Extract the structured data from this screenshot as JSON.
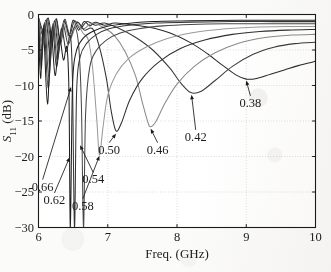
{
  "chart_data": {
    "type": "line",
    "title": "",
    "xlabel": "Freq. (GHz)",
    "ylabel": "S_11 (dB)",
    "ylabel_base": "S",
    "ylabel_sub": "11",
    "ylabel_unit": " (dB)",
    "xlim": [
      6,
      10
    ],
    "ylim": [
      -30,
      0
    ],
    "xticks": [
      6,
      7,
      8,
      9,
      10
    ],
    "xticklabels": [
      "6",
      "7",
      "8",
      "9",
      "10"
    ],
    "yticks": [
      0,
      -5,
      -10,
      -15,
      -20,
      -25,
      -30
    ],
    "yticklabels": [
      "0",
      "−5",
      "−10",
      "−15",
      "−20",
      "−25",
      "−30"
    ],
    "grid": "dotted",
    "legend": "none",
    "series": [
      {
        "name": "0.38",
        "color": "#2a2a2a",
        "min_freq": 9.0,
        "min_value": -9.1,
        "points": [
          [
            6.0,
            -0.4
          ],
          [
            6.08,
            -2.6
          ],
          [
            6.14,
            -0.5
          ],
          [
            6.2,
            -3.4
          ],
          [
            6.26,
            -0.6
          ],
          [
            6.32,
            -4.1
          ],
          [
            6.38,
            -0.7
          ],
          [
            6.44,
            -3.0
          ],
          [
            6.5,
            -0.8
          ],
          [
            6.58,
            -2.2
          ],
          [
            6.66,
            -1.0
          ],
          [
            6.74,
            -1.6
          ],
          [
            6.82,
            -1.1
          ],
          [
            6.95,
            -1.5
          ],
          [
            7.1,
            -1.2
          ],
          [
            7.3,
            -1.4
          ],
          [
            7.6,
            -1.8
          ],
          [
            7.9,
            -2.6
          ],
          [
            8.2,
            -4.0
          ],
          [
            8.45,
            -5.6
          ],
          [
            8.65,
            -7.1
          ],
          [
            8.85,
            -8.5
          ],
          [
            9.0,
            -9.1
          ],
          [
            9.15,
            -9.0
          ],
          [
            9.35,
            -8.4
          ],
          [
            9.55,
            -7.8
          ],
          [
            9.75,
            -7.2
          ],
          [
            10.0,
            -6.6
          ]
        ]
      },
      {
        "name": "0.42",
        "color": "#3a3a3a",
        "min_freq": 8.2,
        "min_value": -11.0,
        "points": [
          [
            6.0,
            -0.5
          ],
          [
            6.07,
            -3.2
          ],
          [
            6.13,
            -0.6
          ],
          [
            6.19,
            -4.4
          ],
          [
            6.25,
            -0.7
          ],
          [
            6.31,
            -3.6
          ],
          [
            6.37,
            -0.8
          ],
          [
            6.45,
            -2.8
          ],
          [
            6.52,
            -0.9
          ],
          [
            6.6,
            -2.0
          ],
          [
            6.7,
            -1.0
          ],
          [
            6.82,
            -1.5
          ],
          [
            6.95,
            -1.2
          ],
          [
            7.15,
            -1.9
          ],
          [
            7.4,
            -3.2
          ],
          [
            7.65,
            -5.0
          ],
          [
            7.9,
            -7.6
          ],
          [
            8.05,
            -9.6
          ],
          [
            8.2,
            -11.0
          ],
          [
            8.35,
            -10.8
          ],
          [
            8.55,
            -9.3
          ],
          [
            8.8,
            -7.3
          ],
          [
            9.1,
            -5.6
          ],
          [
            9.4,
            -4.6
          ],
          [
            9.7,
            -4.1
          ],
          [
            10.0,
            -3.9
          ]
        ]
      },
      {
        "name": "0.46",
        "color": "#8a8a8a",
        "min_freq": 7.62,
        "min_value": -15.8,
        "points": [
          [
            6.0,
            -0.6
          ],
          [
            6.06,
            -4.0
          ],
          [
            6.12,
            -0.7
          ],
          [
            6.18,
            -5.2
          ],
          [
            6.24,
            -0.8
          ],
          [
            6.3,
            -4.2
          ],
          [
            6.38,
            -0.9
          ],
          [
            6.46,
            -3.0
          ],
          [
            6.55,
            -1.0
          ],
          [
            6.65,
            -2.0
          ],
          [
            6.78,
            -1.2
          ],
          [
            6.95,
            -1.9
          ],
          [
            7.1,
            -3.0
          ],
          [
            7.25,
            -5.2
          ],
          [
            7.4,
            -8.6
          ],
          [
            7.5,
            -12.4
          ],
          [
            7.58,
            -15.2
          ],
          [
            7.62,
            -15.8
          ],
          [
            7.7,
            -15.0
          ],
          [
            7.82,
            -12.6
          ],
          [
            8.0,
            -9.8
          ],
          [
            8.25,
            -7.3
          ],
          [
            8.55,
            -5.4
          ],
          [
            8.9,
            -4.0
          ],
          [
            9.3,
            -3.2
          ],
          [
            9.65,
            -2.9
          ],
          [
            10.0,
            -2.8
          ]
        ]
      },
      {
        "name": "0.50",
        "color": "#2f2f2f",
        "min_freq": 7.12,
        "min_value": -16.4,
        "points": [
          [
            6.0,
            -0.7
          ],
          [
            6.05,
            -4.8
          ],
          [
            6.11,
            -0.8
          ],
          [
            6.17,
            -6.0
          ],
          [
            6.23,
            -0.9
          ],
          [
            6.29,
            -4.8
          ],
          [
            6.37,
            -1.0
          ],
          [
            6.46,
            -3.2
          ],
          [
            6.56,
            -1.1
          ],
          [
            6.66,
            -2.2
          ],
          [
            6.78,
            -2.0
          ],
          [
            6.88,
            -4.6
          ],
          [
            6.98,
            -9.0
          ],
          [
            7.05,
            -13.6
          ],
          [
            7.12,
            -16.4
          ],
          [
            7.2,
            -15.2
          ],
          [
            7.32,
            -12.0
          ],
          [
            7.5,
            -9.0
          ],
          [
            7.75,
            -6.6
          ],
          [
            8.05,
            -4.8
          ],
          [
            8.4,
            -3.6
          ],
          [
            8.8,
            -2.8
          ],
          [
            9.2,
            -2.4
          ],
          [
            9.6,
            -2.2
          ],
          [
            10.0,
            -2.1
          ]
        ]
      },
      {
        "name": "0.54",
        "color": "#9a9a9a",
        "min_freq": 6.88,
        "min_value": -19.8,
        "points": [
          [
            6.0,
            -0.9
          ],
          [
            6.05,
            -5.6
          ],
          [
            6.1,
            -1.0
          ],
          [
            6.16,
            -7.4
          ],
          [
            6.22,
            -1.1
          ],
          [
            6.28,
            -5.6
          ],
          [
            6.36,
            -1.2
          ],
          [
            6.45,
            -3.6
          ],
          [
            6.55,
            -1.4
          ],
          [
            6.64,
            -2.6
          ],
          [
            6.72,
            -3.6
          ],
          [
            6.78,
            -7.4
          ],
          [
            6.84,
            -14.6
          ],
          [
            6.88,
            -19.8
          ],
          [
            6.93,
            -16.0
          ],
          [
            7.0,
            -11.4
          ],
          [
            7.12,
            -8.4
          ],
          [
            7.3,
            -6.2
          ],
          [
            7.55,
            -4.6
          ],
          [
            7.85,
            -3.4
          ],
          [
            8.2,
            -2.6
          ],
          [
            8.6,
            -2.1
          ],
          [
            9.1,
            -1.8
          ],
          [
            9.55,
            -1.7
          ],
          [
            10.0,
            -1.7
          ]
        ]
      },
      {
        "name": "0.58",
        "color": "#484848",
        "min_freq": 6.65,
        "min_value": -30.0,
        "points": [
          [
            6.0,
            -1.1
          ],
          [
            6.04,
            -6.6
          ],
          [
            6.09,
            -1.2
          ],
          [
            6.15,
            -8.8
          ],
          [
            6.21,
            -1.3
          ],
          [
            6.27,
            -6.4
          ],
          [
            6.35,
            -1.5
          ],
          [
            6.43,
            -4.2
          ],
          [
            6.52,
            -1.8
          ],
          [
            6.58,
            -4.4
          ],
          [
            6.62,
            -13.0
          ],
          [
            6.65,
            -30.0
          ],
          [
            6.68,
            -14.0
          ],
          [
            6.74,
            -7.4
          ],
          [
            6.84,
            -5.0
          ],
          [
            6.98,
            -3.6
          ],
          [
            7.18,
            -2.6
          ],
          [
            7.45,
            -2.0
          ],
          [
            7.8,
            -1.6
          ],
          [
            8.2,
            -1.4
          ],
          [
            8.7,
            -1.3
          ],
          [
            9.3,
            -1.3
          ],
          [
            10.0,
            -1.3
          ]
        ]
      },
      {
        "name": "0.62",
        "color": "#353535",
        "min_freq": 6.52,
        "min_value": -30.0,
        "points": [
          [
            6.0,
            -1.4
          ],
          [
            6.04,
            -7.6
          ],
          [
            6.08,
            -1.5
          ],
          [
            6.14,
            -10.4
          ],
          [
            6.2,
            -1.7
          ],
          [
            6.26,
            -7.4
          ],
          [
            6.33,
            -2.0
          ],
          [
            6.4,
            -5.2
          ],
          [
            6.46,
            -3.0
          ],
          [
            6.49,
            -9.0
          ],
          [
            6.52,
            -30.0
          ],
          [
            6.55,
            -11.0
          ],
          [
            6.6,
            -6.0
          ],
          [
            6.7,
            -4.0
          ],
          [
            6.84,
            -2.8
          ],
          [
            7.02,
            -2.0
          ],
          [
            7.3,
            -1.5
          ],
          [
            7.7,
            -1.2
          ],
          [
            8.2,
            -1.1
          ],
          [
            8.8,
            -1.0
          ],
          [
            9.4,
            -1.0
          ],
          [
            10.0,
            -1.0
          ]
        ]
      },
      {
        "name": "0.66",
        "color": "#1f1f1f",
        "min_freq": 6.46,
        "min_value": -30.0,
        "points": [
          [
            6.0,
            -1.8
          ],
          [
            6.03,
            -9.0
          ],
          [
            6.07,
            -2.0
          ],
          [
            6.13,
            -12.6
          ],
          [
            6.18,
            -2.4
          ],
          [
            6.24,
            -8.6
          ],
          [
            6.3,
            -3.2
          ],
          [
            6.36,
            -6.4
          ],
          [
            6.41,
            -4.6
          ],
          [
            6.44,
            -11.0
          ],
          [
            6.46,
            -30.0
          ],
          [
            6.49,
            -10.4
          ],
          [
            6.54,
            -5.4
          ],
          [
            6.64,
            -3.4
          ],
          [
            6.78,
            -2.4
          ],
          [
            6.98,
            -1.7
          ],
          [
            7.25,
            -1.3
          ],
          [
            7.65,
            -1.0
          ],
          [
            8.2,
            -0.9
          ],
          [
            8.9,
            -0.8
          ],
          [
            9.5,
            -0.8
          ],
          [
            10.0,
            -0.8
          ]
        ]
      }
    ],
    "annotations": [
      {
        "label": "0.38",
        "text_x": 9.06,
        "text_y": -13.0,
        "tip_x": 9.0,
        "tip_y": -9.3
      },
      {
        "label": "0.42",
        "text_x": 8.27,
        "text_y": -17.8,
        "tip_x": 8.21,
        "tip_y": -11.3
      },
      {
        "label": "0.46",
        "text_x": 7.72,
        "text_y": -19.6,
        "tip_x": 7.62,
        "tip_y": -16.1
      },
      {
        "label": "0.50",
        "text_x": 7.02,
        "text_y": -19.6,
        "tip_x": 7.12,
        "tip_y": -16.8
      },
      {
        "label": "0.54",
        "text_x": 6.79,
        "text_y": -23.8,
        "tip_x": 6.6,
        "tip_y": -18.4
      },
      {
        "label": "0.58",
        "text_x": 6.64,
        "text_y": -27.5,
        "tip_x": 6.88,
        "tip_y": -19.9
      },
      {
        "label": "0.62",
        "text_x": 6.23,
        "text_y": -26.7,
        "tip_x": 6.45,
        "tip_y": -20.1
      },
      {
        "label": "0.66",
        "text_x": 6.06,
        "text_y": -24.8,
        "tip_x": 6.47,
        "tip_y": -10.2
      }
    ]
  }
}
